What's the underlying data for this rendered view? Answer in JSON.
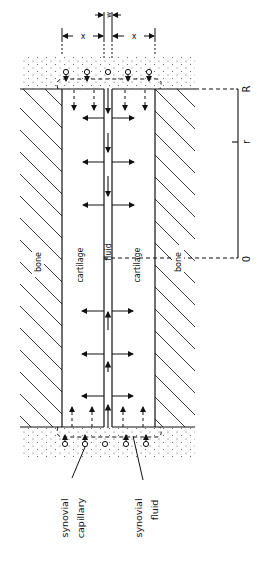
{
  "diagram": {
    "dimension_labels": {
      "gap_width": "w",
      "cartilage_left_thickness": "x",
      "cartilage_right_thickness": "x"
    },
    "regions": {
      "bone_left": "bone",
      "cartilage_left": "cartilage",
      "fluid": "fluid",
      "cartilage_right": "cartilage",
      "bone_right": "bone"
    },
    "radial_axis": {
      "top_label": "R",
      "middle_label": "r",
      "bottom_label": "0"
    },
    "callouts": {
      "synovial_capillary": [
        "synovial",
        "capillary"
      ],
      "synovial_fluid": [
        "synovial",
        "fluid"
      ]
    },
    "colors": {
      "ink": "#111111",
      "background": "#ffffff",
      "stipple": "#555555"
    }
  }
}
